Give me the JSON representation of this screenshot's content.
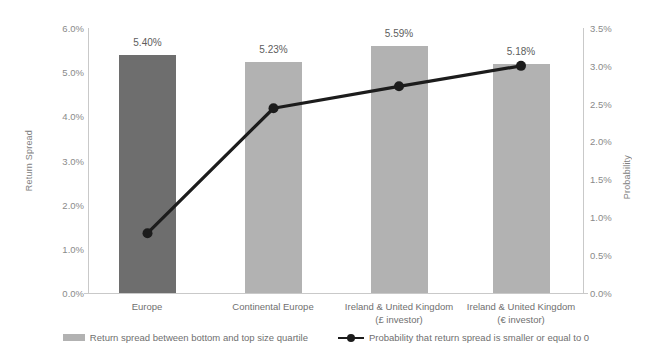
{
  "chart_data": {
    "type": "bar",
    "title": "",
    "xlabel": "",
    "ylabel": "Return Spread",
    "y2label": "Probability",
    "categories": [
      "Europe",
      "Continental Europe",
      "Ireland & United Kingdom\n(£ investor)",
      "Ireland & United Kingdom\n(€ investor)"
    ],
    "category_lines": [
      [
        "Europe",
        ""
      ],
      [
        "Continental Europe",
        ""
      ],
      [
        "Ireland & United Kingdom",
        "(£ investor)"
      ],
      [
        "Ireland & United Kingdom",
        "(€ investor)"
      ]
    ],
    "series": [
      {
        "name": "Return spread between bottom and top size quartile",
        "type": "bar",
        "axis": "left",
        "values": [
          5.4,
          5.23,
          5.59,
          5.18
        ],
        "labels": [
          "5.40%",
          "5.23%",
          "5.59%",
          "5.18%"
        ],
        "colors": [
          "#6e6e6e",
          "#b2b2b2",
          "#b2b2b2",
          "#b2b2b2"
        ]
      },
      {
        "name": "Probability that return spread is smaller or equal to 0",
        "type": "line",
        "axis": "right",
        "values": [
          0.79,
          2.44,
          2.73,
          3.0
        ],
        "color": "#1c1c1c"
      }
    ],
    "ylim": [
      0,
      6.0
    ],
    "y2lim": [
      0,
      3.5
    ],
    "yticks": [
      "0.0%",
      "1.0%",
      "2.0%",
      "3.0%",
      "4.0%",
      "5.0%",
      "6.0%"
    ],
    "y2ticks": [
      "0.0%",
      "0.5%",
      "1.0%",
      "1.5%",
      "2.0%",
      "2.5%",
      "3.0%",
      "3.5%"
    ],
    "grid": false,
    "legend_position": "bottom"
  },
  "legend": {
    "bar_label": "Return spread between bottom and top size quartile",
    "line_label": "Probability that return spread is smaller or equal to 0"
  },
  "axes": {
    "left_title": "Return Spread",
    "right_title": "Probability"
  },
  "colors": {
    "bar_highlight": "#6e6e6e",
    "bar_default": "#b2b2b2",
    "line": "#1c1c1c",
    "axis": "#c9c9c9",
    "text": "#6f6f6f"
  }
}
